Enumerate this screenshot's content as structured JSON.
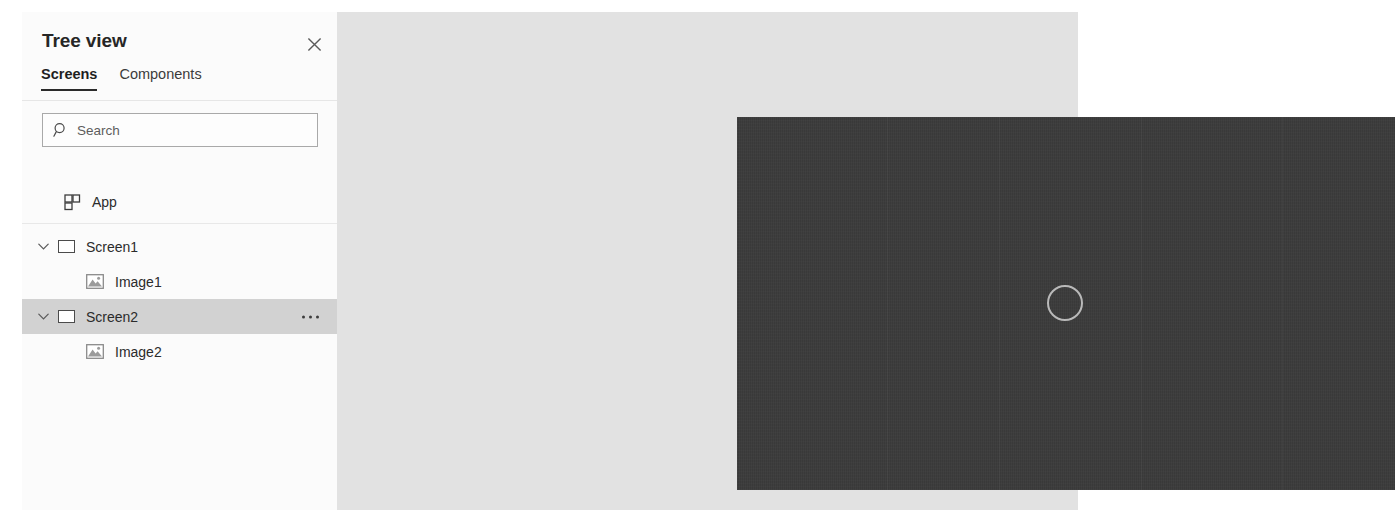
{
  "panel": {
    "title": "Tree view",
    "close_icon": "close-icon",
    "tabs": [
      {
        "label": "Screens",
        "active": true
      },
      {
        "label": "Components",
        "active": false
      }
    ],
    "search": {
      "placeholder": "Search",
      "value": "",
      "icon": "search-icon"
    },
    "app_row": {
      "label": "App",
      "icon": "app-grid-icon"
    },
    "tree": [
      {
        "label": "Screen1",
        "icon": "screen-icon",
        "chevron": "chevron-down-icon",
        "selected": false,
        "expanded": true,
        "children": [
          {
            "label": "Image1",
            "icon": "image-icon"
          }
        ]
      },
      {
        "label": "Screen2",
        "icon": "screen-icon",
        "chevron": "chevron-down-icon",
        "selected": true,
        "expanded": true,
        "overflow_icon": "more-options-icon",
        "children": [
          {
            "label": "Image2",
            "icon": "image-icon"
          }
        ]
      }
    ]
  },
  "canvas": {
    "placeholder_icon": "circle-placeholder-icon",
    "background_color": "#3b3b3b",
    "placeholder_color": "#b9b9b9"
  },
  "workspace": {
    "background_color": "#e2e2e2"
  }
}
